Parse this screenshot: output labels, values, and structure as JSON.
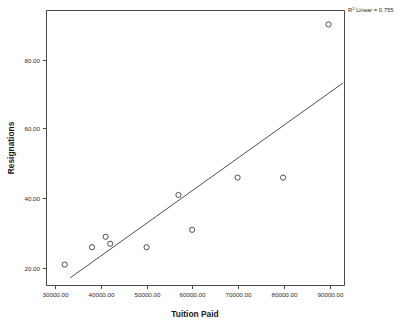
{
  "chart_data": {
    "type": "scatter",
    "title": "",
    "xlabel": "Tuition Paid",
    "ylabel": "Resignations",
    "xlim": [
      28000,
      93500
    ],
    "ylim": [
      14,
      93
    ],
    "grid": false,
    "legend": "none",
    "x_ticks": [
      "30000.00",
      "40000.00",
      "50000.00",
      "60000.00",
      "70000.00",
      "80000.00",
      "90000.00"
    ],
    "x_tick_values": [
      30000,
      40000,
      50000,
      60000,
      70000,
      80000,
      90000
    ],
    "y_ticks": [
      "20.00",
      "40.00",
      "60.00",
      "80.00"
    ],
    "y_tick_values": [
      20,
      40,
      60,
      80
    ],
    "points": [
      {
        "x": 32000,
        "y": 20
      },
      {
        "x": 38000,
        "y": 25
      },
      {
        "x": 41000,
        "y": 28
      },
      {
        "x": 42000,
        "y": 26
      },
      {
        "x": 50000,
        "y": 25
      },
      {
        "x": 57000,
        "y": 40
      },
      {
        "x": 60000,
        "y": 30
      },
      {
        "x": 70000,
        "y": 45
      },
      {
        "x": 80000,
        "y": 45
      },
      {
        "x": 90000,
        "y": 89
      }
    ],
    "fit_line": {
      "type": "linear",
      "x_start": 33200,
      "y_start": 16.2,
      "x_end": 93200,
      "y_end": 72.2
    },
    "annotation": {
      "prefix": "R",
      "superscript": "2",
      "text": " Linear = 0.755",
      "value": 0.755
    },
    "marker_style": "open-circle",
    "marker_color": "#3a3a3a",
    "line_color": "#3a3a3a",
    "axis_color": "#4a4a4a",
    "background_color": "#ffffff"
  }
}
